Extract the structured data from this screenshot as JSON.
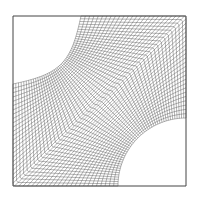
{
  "figure": {
    "type": "structured-mesh",
    "domain_box": {
      "x0": 13,
      "y0": 16,
      "x1": 186,
      "y1": 186
    },
    "cutouts": [
      {
        "corner": "top-left",
        "cx": 13,
        "cy": 16,
        "r": 68
      },
      {
        "corner": "bottom-right",
        "cx": 186,
        "cy": 186,
        "r": 68
      }
    ],
    "grid": {
      "nu": 48,
      "nv": 48
    },
    "line_color": "#555555",
    "border_color": "#444444",
    "background": "#ffffff"
  },
  "caption": ""
}
